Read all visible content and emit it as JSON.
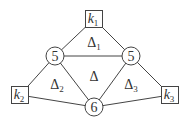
{
  "diagram": {
    "nodes": [
      {
        "id": "k1",
        "shape": "square",
        "label": "k",
        "sub": "1",
        "cx": 94,
        "cy": 19
      },
      {
        "id": "k2",
        "shape": "square",
        "label": "k",
        "sub": "2",
        "cx": 20,
        "cy": 95
      },
      {
        "id": "k3",
        "shape": "square",
        "label": "k",
        "sub": "3",
        "cx": 170,
        "cy": 95
      },
      {
        "id": "cL",
        "shape": "circle",
        "label": "5",
        "cx": 55,
        "cy": 56
      },
      {
        "id": "cR",
        "shape": "circle",
        "label": "5",
        "cx": 131,
        "cy": 56
      },
      {
        "id": "cB",
        "shape": "circle",
        "label": "6",
        "cx": 94,
        "cy": 107
      }
    ],
    "edges": [
      [
        "k1",
        "cL"
      ],
      [
        "k1",
        "cR"
      ],
      [
        "cL",
        "cR"
      ],
      [
        "cL",
        "k2"
      ],
      [
        "cL",
        "cB"
      ],
      [
        "cR",
        "cB"
      ],
      [
        "cR",
        "k3"
      ],
      [
        "k2",
        "cB"
      ],
      [
        "k3",
        "cB"
      ]
    ],
    "regions": [
      {
        "label": "Δ",
        "sub": "1",
        "x": 94,
        "y": 42
      },
      {
        "label": "Δ",
        "sub": "",
        "x": 94,
        "y": 76
      },
      {
        "label": "Δ",
        "sub": "2",
        "x": 57,
        "y": 84
      },
      {
        "label": "Δ",
        "sub": "3",
        "x": 131,
        "y": 84
      }
    ],
    "colors": {
      "stroke": "#444444",
      "text": "#333333",
      "background": "#ffffff"
    }
  }
}
